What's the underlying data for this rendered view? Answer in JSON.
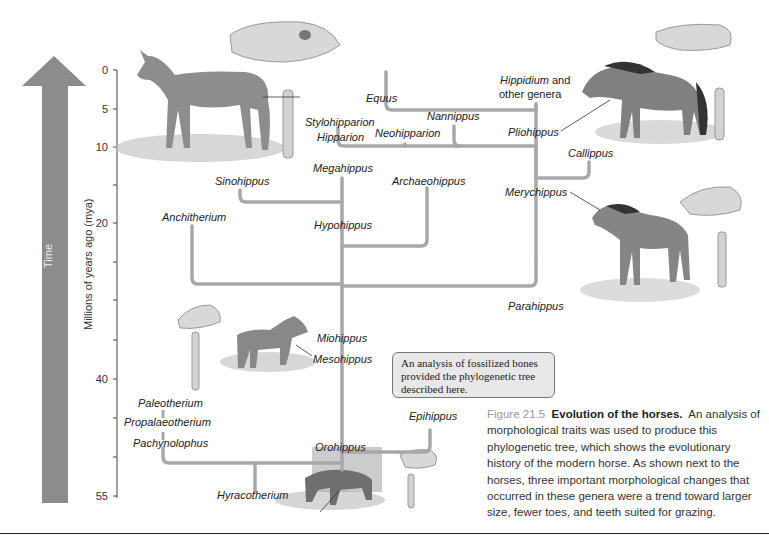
{
  "time_arrow": {
    "label": "Time",
    "color": "#8c8c8c"
  },
  "axis": {
    "title": "Millions of years ago (mya)",
    "ticks": [
      "0",
      "5",
      "10",
      "20",
      "40",
      "55"
    ]
  },
  "genera": {
    "equus": "Equus",
    "hippidium": "Hippidium",
    "hippidium_suffix": " and",
    "other_genera": "other genera",
    "nannippus": "Nannippus",
    "stylohipparion": "Stylohipparion",
    "hipparion": "Hipparion",
    "neohipparion": "Neohipparion",
    "pliohippus": "Pliohippus",
    "callippus": "Callippus",
    "megahippus": "Megahippus",
    "sinohippus": "Sinohippus",
    "archaeohippus": "Archaeohippus",
    "merychippus": "Merychippus",
    "anchitherium": "Anchitherium",
    "hypohippus": "Hypohippus",
    "parahippus": "Parahippus",
    "miohippus": "Miohippus",
    "mesohippus": "Mesohippus",
    "paleotherium": "Paleotherium",
    "propalaeotherium": "Propalaeotherium",
    "pachynolophus": "Pachynolophus",
    "epihippus": "Epihippus",
    "orohippus": "Orohippus",
    "hyracotherium": "Hyracotherium"
  },
  "callout": {
    "text": "An analysis of fossilized bones provided the phylogenetic tree described here."
  },
  "caption": {
    "number": "Figure 21.5",
    "title": "Evolution of the horses.",
    "body": "An analysis of morphological traits was used to produce this phylogenetic tree, which shows the evolutionary history of the modern horse. As shown next to the horses, three important morphological changes that occurred in these genera were a trend toward larger size, fewer toes, and teeth suited for grazing."
  },
  "colors": {
    "branch": "#a8a8a8",
    "arrow": "#8c8c8c",
    "callout_bg": "#e8e8e8"
  }
}
